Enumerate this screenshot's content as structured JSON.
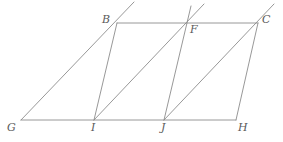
{
  "figure": {
    "type": "geometry-diagram",
    "title": "",
    "canvas": {
      "width": 283,
      "height": 142
    },
    "stroke_color": "#8c8c8c",
    "label_color": "#5a5a5a",
    "background_color": "#ffffff",
    "stroke_width": 0.9
  },
  "points": {
    "B": {
      "label": "B",
      "x": 117,
      "y": 23,
      "label_x": 102,
      "label_y": 14
    },
    "C": {
      "label": "C",
      "x": 258,
      "y": 23,
      "label_x": 262,
      "label_y": 14
    },
    "F": {
      "label": "F",
      "x": 187,
      "y": 23,
      "label_x": 190,
      "label_y": 24
    },
    "G": {
      "label": "G",
      "x": 21,
      "y": 120,
      "label_x": 7,
      "label_y": 122
    },
    "H": {
      "label": "H",
      "x": 236,
      "y": 120,
      "label_x": 238,
      "label_y": 122
    },
    "I": {
      "label": "I",
      "x": 94,
      "y": 120,
      "label_x": 91,
      "label_y": 122
    },
    "J": {
      "label": "J",
      "x": 164,
      "y": 120,
      "label_x": 161,
      "label_y": 122
    }
  },
  "segments": [
    {
      "name": "top-edge-B-C",
      "x1": 117,
      "y1": 23,
      "x2": 258,
      "y2": 23
    },
    {
      "name": "bottom-edge-G-H",
      "x1": 21,
      "y1": 120,
      "x2": 236,
      "y2": 120
    },
    {
      "name": "diagonal-G-B-extended",
      "x1": 21,
      "y1": 120,
      "x2": 134,
      "y2": 2
    },
    {
      "name": "side-B-I",
      "x1": 117,
      "y1": 23,
      "x2": 94,
      "y2": 120
    },
    {
      "name": "diagonal-I-F-extended",
      "x1": 94,
      "y1": 120,
      "x2": 204,
      "y2": 4
    },
    {
      "name": "side-F-J-extended",
      "x1": 191,
      "y1": 6,
      "x2": 164,
      "y2": 120
    },
    {
      "name": "diagonal-J-C-extended",
      "x1": 164,
      "y1": 120,
      "x2": 274,
      "y2": 4
    },
    {
      "name": "side-C-H",
      "x1": 258,
      "y1": 23,
      "x2": 236,
      "y2": 120
    }
  ],
  "labels_order": [
    "B",
    "F",
    "C",
    "G",
    "I",
    "J",
    "H"
  ]
}
